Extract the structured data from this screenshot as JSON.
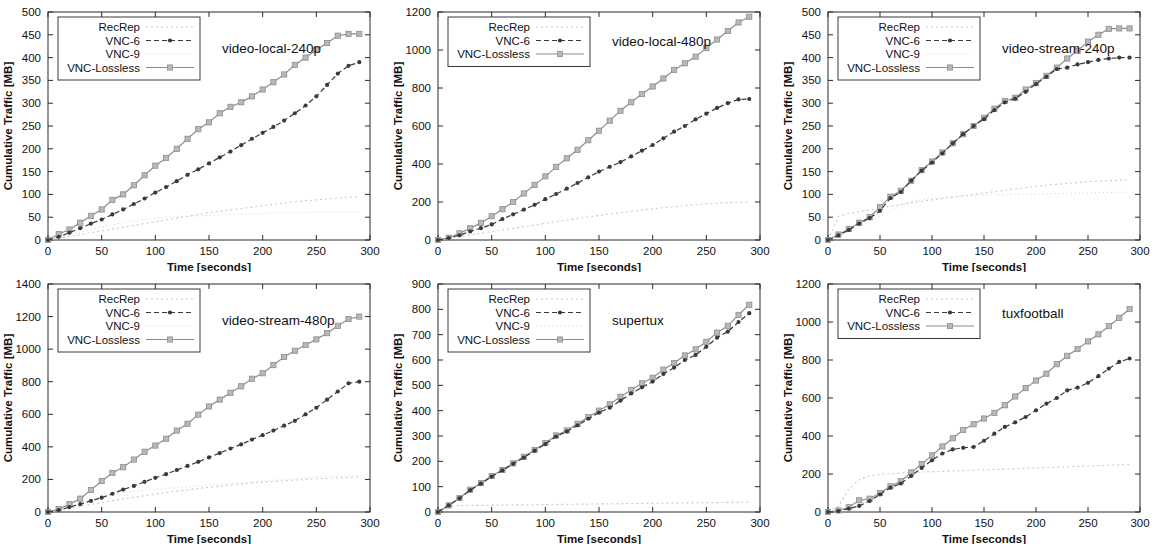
{
  "figure": {
    "axis_labels": {
      "x": "Time [seconds]",
      "y": "Cumulative Traffic [MB]"
    },
    "series_styles": {
      "RecRep": {
        "color": "#c9c9c9",
        "dash": "2,3",
        "marker": "none",
        "width": 1.1
      },
      "VNC-6": {
        "color": "#3a3a3a",
        "dash": "5,3",
        "marker": "dot",
        "width": 1.2
      },
      "VNC-9": {
        "color": "#d6d6d6",
        "dash": "1,3",
        "marker": "none",
        "width": 1.0
      },
      "VNC-Lossless": {
        "color": "#8e8e8e",
        "dash": "none",
        "marker": "square",
        "width": 1.2
      }
    }
  },
  "chart_data": [
    {
      "type": "line",
      "title": "video-local-240p",
      "xlabel": "Time [seconds]",
      "ylabel": "Cumulative Traffic [MB]",
      "xlim": [
        0,
        300
      ],
      "ylim": [
        0,
        500
      ],
      "xticks": [
        0,
        50,
        100,
        150,
        200,
        250,
        300
      ],
      "yticks": [
        0,
        50,
        100,
        150,
        200,
        250,
        300,
        350,
        400,
        450,
        500
      ],
      "grid": false,
      "legend_position": "top-left",
      "legend": [
        "RecRep",
        "VNC-6",
        "VNC-9",
        "VNC-Lossless"
      ],
      "x": [
        0,
        10,
        20,
        30,
        40,
        50,
        60,
        70,
        80,
        90,
        100,
        110,
        120,
        130,
        140,
        150,
        160,
        170,
        180,
        190,
        200,
        210,
        220,
        230,
        240,
        250,
        260,
        270,
        280,
        290
      ],
      "series": [
        {
          "name": "RecRep",
          "values": [
            0,
            4,
            8,
            12,
            16,
            20,
            24,
            28,
            32,
            36,
            40,
            44,
            48,
            52,
            56,
            60,
            63,
            66,
            69,
            72,
            75,
            78,
            81,
            84,
            86,
            88,
            90,
            92,
            94,
            95
          ]
        },
        {
          "name": "VNC-6",
          "values": [
            0,
            7,
            16,
            26,
            36,
            45,
            56,
            67,
            79,
            91,
            104,
            116,
            129,
            143,
            155,
            168,
            181,
            194,
            208,
            222,
            235,
            248,
            262,
            278,
            295,
            315,
            340,
            365,
            382,
            390
          ]
        },
        {
          "name": "VNC-9",
          "values": [
            0,
            5,
            11,
            17,
            23,
            28,
            33,
            38,
            42,
            45,
            48,
            50,
            51,
            52,
            53,
            54,
            55,
            56,
            57,
            58,
            58,
            59,
            59,
            60,
            60,
            61,
            61,
            62,
            62,
            62
          ]
        },
        {
          "name": "VNC-Lossless",
          "values": [
            0,
            13,
            23,
            38,
            53,
            67,
            88,
            100,
            120,
            142,
            163,
            180,
            200,
            222,
            243,
            258,
            278,
            292,
            302,
            315,
            330,
            346,
            363,
            384,
            400,
            417,
            432,
            448,
            452,
            452
          ]
        }
      ]
    },
    {
      "type": "line",
      "title": "video-local-480p",
      "xlabel": "Time [seconds]",
      "ylabel": "Cumulative Traffic [MB]",
      "xlim": [
        0,
        300
      ],
      "ylim": [
        0,
        1200
      ],
      "xticks": [
        0,
        50,
        100,
        150,
        200,
        250,
        300
      ],
      "yticks": [
        0,
        200,
        400,
        600,
        800,
        1000,
        1200
      ],
      "grid": false,
      "legend_position": "top-left",
      "legend": [
        "RecRep",
        "VNC-6",
        "VNC-Lossless"
      ],
      "x": [
        0,
        10,
        20,
        30,
        40,
        50,
        60,
        70,
        80,
        90,
        100,
        110,
        120,
        130,
        140,
        150,
        160,
        170,
        180,
        190,
        200,
        210,
        220,
        230,
        240,
        250,
        260,
        270,
        280,
        290
      ],
      "series": [
        {
          "name": "RecRep",
          "values": [
            0,
            8,
            17,
            26,
            35,
            44,
            53,
            62,
            70,
            79,
            88,
            97,
            105,
            113,
            121,
            129,
            137,
            144,
            151,
            158,
            164,
            170,
            176,
            181,
            186,
            190,
            194,
            197,
            199,
            200
          ]
        },
        {
          "name": "VNC-6",
          "values": [
            0,
            10,
            25,
            45,
            62,
            82,
            110,
            135,
            160,
            185,
            215,
            242,
            270,
            300,
            330,
            360,
            385,
            410,
            440,
            470,
            500,
            535,
            570,
            600,
            635,
            665,
            695,
            720,
            740,
            742
          ]
        },
        {
          "name": "VNC-Lossless",
          "values": [
            0,
            12,
            35,
            62,
            90,
            125,
            162,
            200,
            245,
            290,
            335,
            385,
            430,
            475,
            525,
            575,
            628,
            680,
            725,
            768,
            808,
            850,
            895,
            930,
            965,
            1010,
            1055,
            1100,
            1145,
            1175
          ]
        }
      ]
    },
    {
      "type": "line",
      "title": "video-stream-240p",
      "xlabel": "Time [seconds]",
      "ylabel": "Cumulative Traffic [MB]",
      "xlim": [
        0,
        300
      ],
      "ylim": [
        0,
        500
      ],
      "xticks": [
        0,
        50,
        100,
        150,
        200,
        250,
        300
      ],
      "yticks": [
        0,
        50,
        100,
        150,
        200,
        250,
        300,
        350,
        400,
        450,
        500
      ],
      "grid": false,
      "legend_position": "top-left",
      "legend": [
        "RecRep",
        "VNC-6",
        "VNC-9",
        "VNC-Lossless"
      ],
      "x": [
        0,
        10,
        20,
        30,
        40,
        50,
        60,
        70,
        80,
        90,
        100,
        110,
        120,
        130,
        140,
        150,
        160,
        170,
        180,
        190,
        200,
        210,
        220,
        230,
        240,
        250,
        260,
        270,
        280,
        290
      ],
      "series": [
        {
          "name": "RecRep",
          "values": [
            0,
            52,
            58,
            62,
            66,
            70,
            74,
            78,
            82,
            85,
            88,
            91,
            94,
            97,
            100,
            103,
            106,
            109,
            112,
            115,
            118,
            120,
            122,
            124,
            126,
            128,
            129,
            130,
            131,
            132
          ]
        },
        {
          "name": "VNC-6",
          "values": [
            0,
            10,
            22,
            36,
            48,
            64,
            92,
            105,
            130,
            152,
            170,
            190,
            212,
            232,
            250,
            265,
            285,
            302,
            310,
            325,
            342,
            358,
            375,
            378,
            385,
            390,
            395,
            398,
            400,
            400
          ]
        },
        {
          "name": "VNC-9",
          "values": [
            0,
            8,
            18,
            28,
            40,
            52,
            64,
            76,
            84,
            88,
            91,
            93,
            95,
            96,
            97,
            98,
            99,
            99,
            100,
            100,
            101,
            101,
            102,
            102,
            103,
            103,
            104,
            104,
            105,
            105
          ]
        },
        {
          "name": "VNC-Lossless",
          "values": [
            0,
            12,
            24,
            38,
            50,
            72,
            95,
            108,
            130,
            153,
            172,
            192,
            212,
            232,
            250,
            268,
            288,
            305,
            312,
            330,
            344,
            360,
            378,
            398,
            415,
            435,
            450,
            463,
            464,
            464
          ]
        }
      ]
    },
    {
      "type": "line",
      "title": "video-stream-480p",
      "xlabel": "Time [seconds]",
      "ylabel": "Cumulative Traffic [MB]",
      "xlim": [
        0,
        300
      ],
      "ylim": [
        0,
        1400
      ],
      "xticks": [
        0,
        50,
        100,
        150,
        200,
        250,
        300
      ],
      "yticks": [
        0,
        200,
        400,
        600,
        800,
        1000,
        1200,
        1400
      ],
      "grid": false,
      "legend_position": "top-left",
      "legend": [
        "RecRep",
        "VNC-6",
        "VNC-9",
        "VNC-Lossless"
      ],
      "x": [
        0,
        10,
        20,
        30,
        40,
        50,
        60,
        70,
        80,
        90,
        100,
        110,
        120,
        130,
        140,
        150,
        160,
        170,
        180,
        190,
        200,
        210,
        220,
        230,
        240,
        250,
        260,
        270,
        280,
        290
      ],
      "series": [
        {
          "name": "RecRep",
          "values": [
            0,
            10,
            22,
            34,
            46,
            58,
            70,
            80,
            90,
            100,
            110,
            120,
            128,
            136,
            144,
            152,
            159,
            166,
            172,
            178,
            183,
            188,
            192,
            196,
            200,
            204,
            207,
            210,
            212,
            214
          ]
        },
        {
          "name": "VNC-6",
          "values": [
            0,
            12,
            30,
            48,
            68,
            88,
            112,
            138,
            160,
            185,
            210,
            232,
            258,
            283,
            308,
            335,
            362,
            390,
            415,
            445,
            472,
            500,
            530,
            560,
            600,
            640,
            690,
            740,
            790,
            800
          ]
        },
        {
          "name": "VNC-9",
          "values": [
            0,
            14,
            32,
            52,
            72,
            92,
            108,
            120,
            128,
            134,
            140,
            145,
            150,
            155,
            160,
            165,
            170,
            175,
            180,
            185,
            190,
            195,
            200,
            205,
            210,
            215,
            220,
            222,
            224,
            225
          ]
        },
        {
          "name": "VNC-Lossless",
          "values": [
            0,
            18,
            48,
            82,
            135,
            190,
            240,
            275,
            322,
            370,
            408,
            450,
            500,
            542,
            598,
            648,
            690,
            732,
            772,
            818,
            852,
            902,
            952,
            990,
            1025,
            1060,
            1098,
            1143,
            1185,
            1200
          ]
        }
      ]
    },
    {
      "type": "line",
      "title": "supertux",
      "xlabel": "Time [seconds]",
      "ylabel": "Cumulative Traffic [MB]",
      "xlim": [
        0,
        300
      ],
      "ylim": [
        0,
        900
      ],
      "xticks": [
        0,
        50,
        100,
        150,
        200,
        250,
        300
      ],
      "yticks": [
        0,
        100,
        200,
        300,
        400,
        500,
        600,
        700,
        800,
        900
      ],
      "grid": false,
      "legend_position": "top-left",
      "legend": [
        "RecRep",
        "VNC-6",
        "VNC-9",
        "VNC-Lossless"
      ],
      "x": [
        0,
        10,
        20,
        30,
        40,
        50,
        60,
        70,
        80,
        90,
        100,
        110,
        120,
        130,
        140,
        150,
        160,
        170,
        180,
        190,
        200,
        210,
        220,
        230,
        240,
        250,
        260,
        270,
        280,
        290
      ],
      "series": [
        {
          "name": "RecRep",
          "values": [
            0,
            24,
            25,
            26,
            26,
            27,
            27,
            28,
            28,
            29,
            29,
            30,
            30,
            31,
            31,
            32,
            32,
            33,
            33,
            34,
            34,
            35,
            35,
            36,
            36,
            37,
            37,
            38,
            38,
            39
          ]
        },
        {
          "name": "VNC-6",
          "values": [
            0,
            26,
            54,
            86,
            112,
            140,
            164,
            190,
            215,
            242,
            268,
            298,
            318,
            342,
            368,
            392,
            412,
            440,
            468,
            492,
            515,
            545,
            570,
            600,
            620,
            652,
            688,
            712,
            750,
            785
          ]
        },
        {
          "name": "VNC-9",
          "values": [
            0,
            25,
            53,
            85,
            110,
            138,
            162,
            188,
            213,
            240,
            266,
            296,
            317,
            341,
            366,
            390,
            411,
            438,
            466,
            490,
            513,
            543,
            568,
            598,
            618,
            650,
            686,
            710,
            748,
            782
          ]
        },
        {
          "name": "VNC-Lossless",
          "values": [
            0,
            26,
            55,
            88,
            114,
            142,
            166,
            192,
            218,
            245,
            272,
            302,
            322,
            348,
            375,
            400,
            425,
            455,
            482,
            508,
            530,
            562,
            588,
            618,
            642,
            672,
            708,
            735,
            778,
            818
          ]
        }
      ]
    },
    {
      "type": "line",
      "title": "tuxfootball",
      "xlabel": "Time [seconds]",
      "ylabel": "Cumulative Traffic [MB]",
      "xlim": [
        0,
        300
      ],
      "ylim": [
        0,
        1200
      ],
      "xticks": [
        0,
        50,
        100,
        150,
        200,
        250,
        300
      ],
      "yticks": [
        0,
        200,
        400,
        600,
        800,
        1000,
        1200
      ],
      "grid": false,
      "legend_position": "top-left",
      "legend": [
        "RecRep",
        "VNC-6",
        "VNC-Lossless"
      ],
      "x": [
        0,
        10,
        20,
        30,
        40,
        50,
        60,
        70,
        80,
        90,
        100,
        110,
        120,
        130,
        140,
        150,
        160,
        170,
        180,
        190,
        200,
        210,
        220,
        230,
        240,
        250,
        260,
        270,
        280,
        290
      ],
      "series": [
        {
          "name": "RecRep",
          "values": [
            0,
            30,
            120,
            170,
            190,
            198,
            202,
            205,
            208,
            210,
            212,
            214,
            216,
            218,
            220,
            222,
            224,
            226,
            228,
            230,
            232,
            234,
            236,
            238,
            240,
            242,
            244,
            246,
            248,
            250
          ]
        },
        {
          "name": "VNC-6",
          "values": [
            0,
            5,
            18,
            32,
            58,
            92,
            128,
            150,
            190,
            232,
            272,
            308,
            330,
            338,
            342,
            375,
            412,
            448,
            472,
            500,
            535,
            570,
            600,
            640,
            655,
            680,
            715,
            755,
            790,
            808
          ]
        },
        {
          "name": "VNC-Lossless",
          "values": [
            0,
            8,
            25,
            62,
            70,
            100,
            135,
            162,
            208,
            252,
            298,
            345,
            388,
            432,
            462,
            492,
            522,
            562,
            608,
            652,
            692,
            728,
            778,
            822,
            858,
            898,
            935,
            978,
            1022,
            1068
          ]
        }
      ]
    }
  ]
}
